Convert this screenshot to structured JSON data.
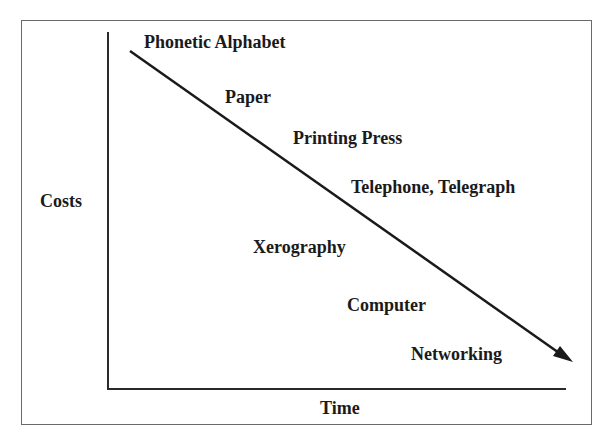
{
  "diagram": {
    "y_axis_label": "Costs",
    "x_axis_label": "Time",
    "trend": "decreasing",
    "milestones": [
      {
        "label": "Phonetic Alphabet"
      },
      {
        "label": "Paper"
      },
      {
        "label": "Printing Press"
      },
      {
        "label": "Telephone, Telegraph"
      },
      {
        "label": "Xerography"
      },
      {
        "label": "Computer"
      },
      {
        "label": "Networking"
      }
    ],
    "colors": {
      "line": "#1a1a1a",
      "border": "#6a6a6a",
      "background": "#ffffff"
    }
  }
}
